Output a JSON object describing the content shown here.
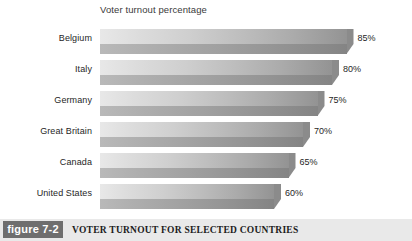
{
  "chart_data": {
    "type": "bar",
    "orientation": "horizontal",
    "title": "Voter turnout percentage",
    "xlabel": "",
    "ylabel": "",
    "grid": false,
    "legend": null,
    "xlim": [
      0,
      100
    ],
    "categories": [
      "Belgium",
      "Italy",
      "Germany",
      "Great Britain",
      "Canada",
      "United States"
    ],
    "values": [
      85,
      80,
      75,
      70,
      65,
      60
    ],
    "value_labels": [
      "85%",
      "80%",
      "75%",
      "70%",
      "65%",
      "60%"
    ],
    "bars": [
      {
        "category": "Belgium",
        "value": 85,
        "label": "85%"
      },
      {
        "category": "Italy",
        "value": 80,
        "label": "80%"
      },
      {
        "category": "Germany",
        "value": 75,
        "label": "75%"
      },
      {
        "category": "Great Britain",
        "value": 70,
        "label": "70%"
      },
      {
        "category": "Canada",
        "value": 65,
        "label": "65%"
      },
      {
        "category": "United States",
        "value": 60,
        "label": "60%"
      }
    ]
  },
  "caption": {
    "figure_number": "figure 7-2",
    "title": "VOTER TURNOUT FOR SELECTED COUNTRIES"
  },
  "colors": {
    "background": "#ffffff",
    "caption_bar": "#e9e9e9",
    "figure_box": "#6e6e6e",
    "bar_light": "#e8e8e8",
    "bar_dark": "#8a8a8a",
    "text": "#262626"
  }
}
